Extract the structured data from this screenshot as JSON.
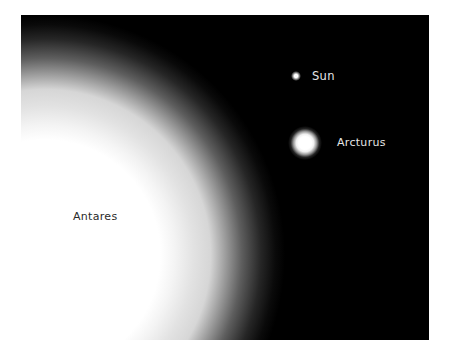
{
  "figure": {
    "background_color": "#000000",
    "stars": [
      {
        "name": "Antares",
        "label": "Antares",
        "relative_size": "very large",
        "label_color": "#2a2a2a"
      },
      {
        "name": "Arcturus",
        "label": "Arcturus",
        "relative_size": "medium",
        "label_color": "#e6e6e6"
      },
      {
        "name": "Sun",
        "label": "Sun",
        "relative_size": "small",
        "label_color": "#e6e6e6"
      }
    ]
  },
  "labels": {
    "sun": "Sun",
    "arcturus": "Arcturus",
    "antares": "Antares"
  }
}
